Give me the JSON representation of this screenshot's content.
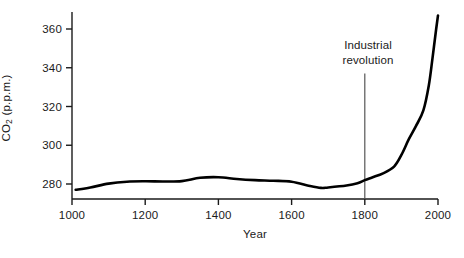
{
  "chart_data": {
    "type": "line",
    "title": "",
    "xlabel": "Year",
    "ylabel": "CO2 (p.p.m.)",
    "ylabel_parts": {
      "prefix": "CO",
      "sub": "2",
      "suffix": " (p.p.m.)"
    },
    "xlim": [
      1000,
      2000
    ],
    "ylim": [
      272,
      372
    ],
    "grid": false,
    "legend": null,
    "x_ticks": [
      1000,
      1200,
      1400,
      1600,
      1800,
      2000
    ],
    "x_tick_labels": [
      "1000",
      "1200",
      "1400",
      "1600",
      "1800",
      "2000"
    ],
    "y_ticks": [
      280,
      300,
      320,
      340,
      360
    ],
    "y_tick_labels": [
      "280",
      "300",
      "320",
      "340",
      "360"
    ],
    "series": [
      {
        "name": "Atmospheric CO2 concentration",
        "color": "#000000",
        "line_width": 2.6,
        "x": [
          1010,
          1050,
          1100,
          1150,
          1200,
          1250,
          1300,
          1350,
          1400,
          1450,
          1500,
          1550,
          1600,
          1650,
          1680,
          1700,
          1750,
          1780,
          1800,
          1820,
          1850,
          1880,
          1900,
          1920,
          1940,
          1960,
          1975,
          1985,
          1995,
          2000
        ],
        "y": [
          277.0,
          278.2,
          280.2,
          281.2,
          281.4,
          281.3,
          281.5,
          283.2,
          283.5,
          282.6,
          282.0,
          281.7,
          281.2,
          279.0,
          278.0,
          278.2,
          279.2,
          280.4,
          282.0,
          283.4,
          285.5,
          289.0,
          295.0,
          303.0,
          310.0,
          318.0,
          331.0,
          345.0,
          360.0,
          367.0
        ]
      }
    ],
    "annotations": [
      {
        "name": "industrial-revolution",
        "text_lines": [
          "Industrial",
          "revolution"
        ],
        "x": 1800,
        "marker_type": "vline",
        "vline_top_value": 337,
        "vline_bottom_value": 272,
        "color": "#555555"
      }
    ],
    "axis": {
      "color": "#1a1a1a",
      "line_width": 1.4,
      "tick_length": 6,
      "spines": [
        "left",
        "bottom"
      ]
    }
  }
}
